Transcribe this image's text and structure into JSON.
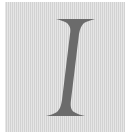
{
  "tile": {
    "letter": "I",
    "style": "italic-serif",
    "colors": {
      "background": "#d9d9d9",
      "glyph": "#6b6b6b",
      "margin": "#ffffff"
    }
  }
}
